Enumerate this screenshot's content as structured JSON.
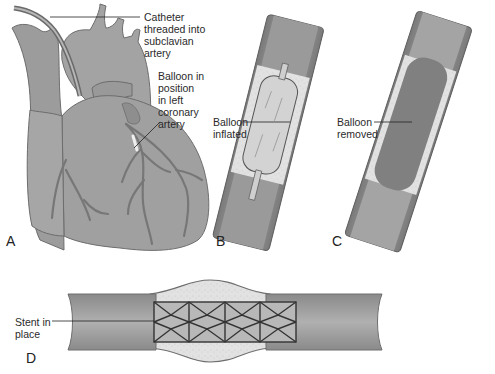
{
  "figure": {
    "panels": [
      {
        "id": "A",
        "letter": "A",
        "subject": "heart with catheter"
      },
      {
        "id": "B",
        "letter": "B",
        "subject": "artery with balloon inflated"
      },
      {
        "id": "C",
        "letter": "C",
        "subject": "artery with balloon removed"
      },
      {
        "id": "D",
        "letter": "D",
        "subject": "artery with stent in place"
      }
    ],
    "labels": {
      "catheter": "Catheter\nthreaded into\nsubclavian\nartery",
      "balloon_position": "Balloon in\nposition\nin left\ncoronary\nartery",
      "balloon_inflated": "Balloon\ninflated",
      "balloon_removed": "Balloon\nremoved",
      "stent": "Stent in\nplace"
    },
    "caption_cropped": ""
  },
  "colors": {
    "tissue": "#9a9a9a",
    "tissue_dark": "#6e6e6e",
    "lumen": "#b3b3b3",
    "plaque": "#e4e4e4",
    "balloon": "#d2d2d2",
    "stent": "#3a3a3a",
    "leader": "#222222"
  }
}
